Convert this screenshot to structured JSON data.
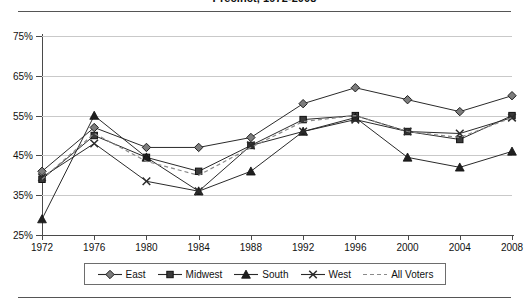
{
  "title": "Precinct, 1972-2008",
  "axes": {
    "y_ticks": [
      "25%",
      "35%",
      "45%",
      "55%",
      "65%",
      "75%"
    ],
    "x_ticks": [
      "1972",
      "1976",
      "1980",
      "1984",
      "1988",
      "1992",
      "1996",
      "2000",
      "2004",
      "2008"
    ]
  },
  "legend": {
    "items": [
      {
        "label": "East",
        "marker": "diamond-marker",
        "color": "#7d7d7d",
        "dash": "none"
      },
      {
        "label": "Midwest",
        "marker": "square-marker",
        "color": "#3a3a3a",
        "dash": "none"
      },
      {
        "label": "South",
        "marker": "triangle-marker",
        "color": "#1f1f1f",
        "dash": "none"
      },
      {
        "label": "West",
        "marker": "x-marker",
        "color": "#2b2b2b",
        "dash": "none"
      },
      {
        "label": "All Voters",
        "marker": "none",
        "color": "#8a8a8a",
        "dash": "4,3"
      }
    ]
  },
  "chart_data": {
    "type": "line",
    "title": "Precinct, 1972-2008",
    "xlabel": "",
    "ylabel": "",
    "x": [
      1972,
      1976,
      1980,
      1984,
      1988,
      1992,
      1996,
      2000,
      2004,
      2008
    ],
    "categories": [
      "1972",
      "1976",
      "1980",
      "1984",
      "1988",
      "1992",
      "1996",
      "2000",
      "2004",
      "2008"
    ],
    "ylim": [
      25,
      75
    ],
    "ytick_values": [
      25,
      35,
      45,
      55,
      65,
      75
    ],
    "grid": "horizontal",
    "legend_position": "bottom",
    "series": [
      {
        "name": "East",
        "marker": "diamond",
        "values": [
          41,
          52,
          47,
          47,
          49.5,
          58,
          62,
          59,
          56,
          60
        ]
      },
      {
        "name": "Midwest",
        "marker": "square",
        "values": [
          39,
          50,
          44.5,
          41,
          47.5,
          54,
          55,
          51,
          49,
          55
        ]
      },
      {
        "name": "South",
        "marker": "triangle",
        "values": [
          29,
          55,
          44.5,
          36,
          41,
          51,
          54.5,
          44.5,
          42,
          46
        ]
      },
      {
        "name": "West",
        "marker": "x",
        "values": [
          39.5,
          48,
          38.5,
          36,
          47.5,
          51,
          54,
          51,
          50.5,
          54.5
        ]
      },
      {
        "name": "All Voters",
        "marker": "none",
        "values": [
          39,
          50.5,
          43.5,
          40,
          47,
          53.5,
          55,
          51,
          49.5,
          54.5
        ]
      }
    ]
  }
}
